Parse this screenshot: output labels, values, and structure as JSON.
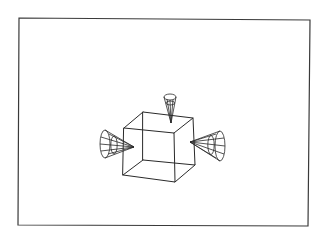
{
  "diagram": {
    "frame": {
      "corners": [
        [
          19,
          18
        ],
        [
          310,
          20
        ],
        [
          308,
          226
        ],
        [
          18,
          225
        ]
      ],
      "stroke": "#3a3a3a"
    },
    "cube": {
      "vertices": {
        "front_top_left": [
          124,
          128
        ],
        "front_top_right": [
          174,
          133
        ],
        "front_bottom_left": [
          123,
          175
        ],
        "front_bottom_right": [
          175,
          182
        ],
        "back_top_left": [
          143,
          112
        ],
        "back_top_right": [
          193,
          118
        ],
        "back_bottom_left": [
          143,
          160
        ],
        "back_bottom_right": [
          195,
          165
        ]
      },
      "stroke": "#2a2a2a"
    },
    "cones": [
      {
        "name": "top-cone",
        "apex": [
          171,
          123
        ],
        "base_center": [
          170,
          97
        ],
        "base_rx": 6,
        "base_ry": 3,
        "orientation": "downward"
      },
      {
        "name": "left-cone",
        "apex": [
          134,
          147
        ],
        "base_center": [
          105,
          144
        ],
        "base_rx": 5,
        "base_ry": 14,
        "orientation": "rightward"
      },
      {
        "name": "right-cone",
        "apex": [
          190,
          142
        ],
        "base_center": [
          220,
          146
        ],
        "base_rx": 5,
        "base_ry": 15,
        "orientation": "leftward"
      }
    ]
  }
}
